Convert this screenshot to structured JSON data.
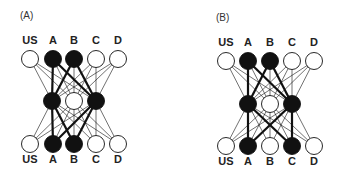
{
  "colors": {
    "ink": "#111111",
    "paper": "#ffffff",
    "active": "#111111"
  },
  "unit_labels": [
    "US",
    "A",
    "B",
    "C",
    "D"
  ],
  "panels": [
    {
      "id": "A",
      "label": "(A)",
      "label_pos": [
        20,
        19
      ],
      "x_input": [
        30,
        53,
        74,
        96,
        118
      ],
      "x_hidden": [
        52,
        74,
        96
      ],
      "y_top_label": 44,
      "y_top": 59,
      "y_hidden": 101,
      "y_bottom": 144,
      "y_bottom_label": 163,
      "top_active": [
        false,
        true,
        true,
        false,
        false
      ],
      "hidden_active": [
        true,
        false,
        true
      ],
      "bottom_active": [
        false,
        true,
        true,
        false,
        false
      ],
      "strong_edges_top": [
        [
          1,
          0
        ],
        [
          1,
          2
        ],
        [
          2,
          0
        ],
        [
          2,
          2
        ]
      ],
      "strong_edges_bottom": [
        [
          0,
          1
        ],
        [
          0,
          2
        ],
        [
          2,
          1
        ],
        [
          2,
          2
        ]
      ]
    },
    {
      "id": "B",
      "label": "(B)",
      "label_pos": [
        216,
        21
      ],
      "x_input": [
        226,
        248,
        270,
        292,
        314
      ],
      "x_hidden": [
        248,
        270,
        292
      ],
      "y_top_label": 46,
      "y_top": 61,
      "y_hidden": 104,
      "y_bottom": 146,
      "y_bottom_label": 165,
      "top_active": [
        false,
        true,
        true,
        false,
        false
      ],
      "hidden_active": [
        true,
        false,
        true
      ],
      "bottom_active": [
        false,
        true,
        false,
        true,
        false
      ],
      "strong_edges_top": [
        [
          1,
          0
        ],
        [
          1,
          2
        ],
        [
          2,
          0
        ],
        [
          2,
          2
        ]
      ],
      "strong_edges_bottom": [
        [
          0,
          1
        ],
        [
          0,
          3
        ],
        [
          2,
          1
        ],
        [
          2,
          3
        ]
      ]
    }
  ]
}
